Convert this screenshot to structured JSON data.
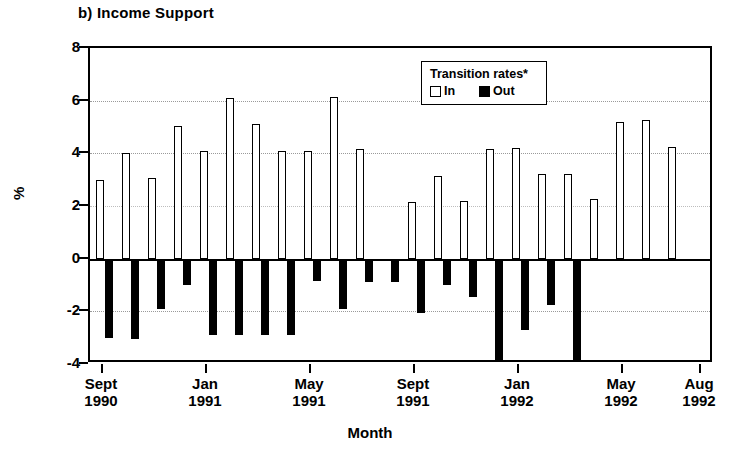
{
  "chart_data": {
    "type": "bar",
    "title": "b) Income Support",
    "xlabel": "Month",
    "ylabel": "%",
    "ylim": [
      -4,
      8
    ],
    "yticks": [
      8,
      6,
      4,
      2,
      0,
      -2,
      -4
    ],
    "ytick_labels": [
      "8",
      "6",
      "4",
      "2",
      "0",
      "-2",
      "-4"
    ],
    "grid": true,
    "grid_axis": "y",
    "legend": {
      "title": "Transition rates*",
      "position": "top-center",
      "entries": [
        {
          "name": "In",
          "fill": "#ffffff",
          "edge": "#000000"
        },
        {
          "name": "Out",
          "fill": "#000000",
          "edge": "#000000"
        }
      ]
    },
    "xtick_labels": [
      {
        "line1": "Sept",
        "line2": "1990"
      },
      {
        "line1": "Jan",
        "line2": "1991"
      },
      {
        "line1": "May",
        "line2": "1991"
      },
      {
        "line1": "Sept",
        "line2": "1991"
      },
      {
        "line1": "Jan",
        "line2": "1992"
      },
      {
        "line1": "May",
        "line2": "1992"
      },
      {
        "line1": "Aug",
        "line2": "1992"
      }
    ],
    "xtick_index": [
      0,
      4,
      8,
      12,
      16,
      20,
      23
    ],
    "categories": [
      "Sept 1990",
      "Oct 1990",
      "Nov 1990",
      "Dec 1990",
      "Jan 1991",
      "Feb 1991",
      "Mar 1991",
      "Apr 1991",
      "May 1991",
      "Jun 1991",
      "Jul 1991",
      "Aug 1991",
      "Sept 1991",
      "Oct 1991",
      "Nov 1991",
      "Dec 1991",
      "Jan 1992",
      "Feb 1992",
      "Mar 1992",
      "Apr 1992",
      "May 1992",
      "Jun 1992",
      "Jul 1992",
      "Aug 1992"
    ],
    "series": [
      {
        "name": "In",
        "values": [
          3.0,
          4.0,
          3.05,
          5.05,
          4.1,
          6.1,
          5.1,
          4.1,
          4.1,
          6.15,
          4.15,
          null,
          2.15,
          3.15,
          2.2,
          4.15,
          4.2,
          3.2,
          3.2,
          2.25,
          5.2,
          5.25,
          4.25,
          null
        ]
      },
      {
        "name": "Out",
        "values": [
          -3.0,
          -3.05,
          -1.9,
          -1.0,
          -2.9,
          -2.9,
          -2.9,
          -2.9,
          -0.85,
          -1.9,
          -0.9,
          -0.9,
          -2.05,
          -1.0,
          -1.45,
          -3.95,
          -2.7,
          -1.75,
          -3.95,
          null,
          null,
          null,
          null,
          null
        ]
      }
    ],
    "series_note": "Bars are plotted as month pairs; In above zero, Out below zero"
  },
  "colors": {
    "bar_in_fill": "#ffffff",
    "bar_out_fill": "#000000",
    "axis": "#000000",
    "grid": "#9a9a9a",
    "background": "#ffffff"
  }
}
